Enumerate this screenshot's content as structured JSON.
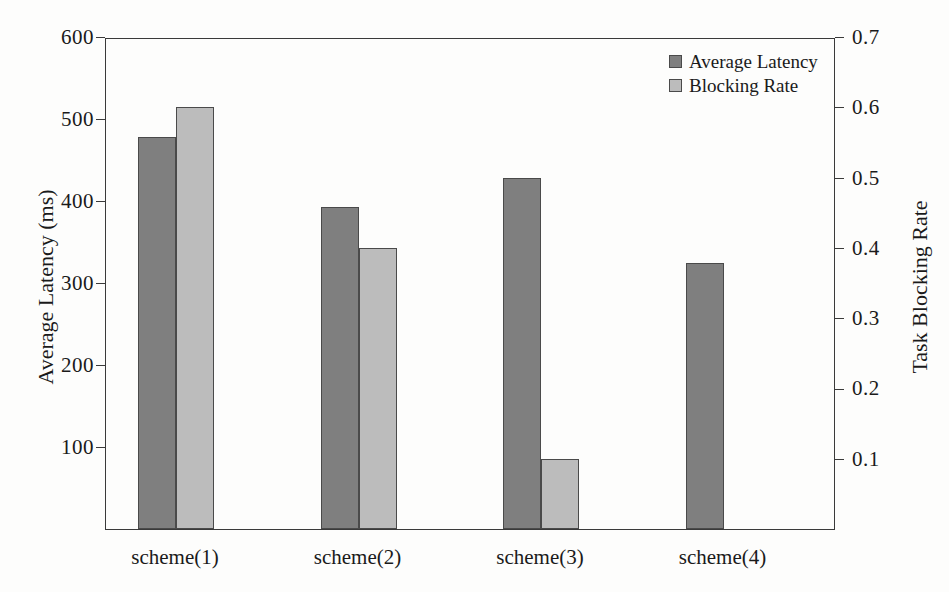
{
  "chart_data": {
    "type": "bar",
    "title": "",
    "categories": [
      "scheme(1)",
      "scheme(2)",
      "scheme(3)",
      "scheme(4)"
    ],
    "series": [
      {
        "name": "Average Latency",
        "axis": "left",
        "unit": "ms",
        "color": "#7f7f7f",
        "values": [
          478,
          393,
          428,
          325
        ]
      },
      {
        "name": "Blocking Rate",
        "axis": "right",
        "unit": "",
        "color": "#bcbcbc",
        "values": [
          0.6,
          0.4,
          0.1,
          0.0
        ]
      }
    ],
    "xlabel": "",
    "ylabel": "Average Latency (ms)",
    "y2label": "Task Blocking Rate",
    "ylim": [
      0,
      600
    ],
    "y2lim": [
      0,
      0.7
    ],
    "yticks": [
      100,
      200,
      300,
      400,
      500,
      600
    ],
    "ytick_labels": [
      "100",
      "200",
      "300",
      "400",
      "500",
      "600"
    ],
    "y2ticks": [
      0.1,
      0.2,
      0.3,
      0.4,
      0.5,
      0.6,
      0.7
    ],
    "y2tick_labels": [
      "0.1",
      "0.2",
      "0.3",
      "0.4",
      "0.5",
      "0.6",
      "0.7"
    ],
    "grid": false,
    "legend_position": "top-right",
    "legend": [
      "Average Latency",
      "Blocking Rate"
    ],
    "annotations": []
  },
  "axes": {
    "left_title": "Average Latency (ms)",
    "right_title": "Task Blocking Rate"
  },
  "legend": {
    "items": [
      {
        "label": "Average Latency",
        "color": "#7f7f7f"
      },
      {
        "label": "Blocking Rate",
        "color": "#bcbcbc"
      }
    ]
  },
  "artifact": {
    "top_bleed_text": ""
  }
}
